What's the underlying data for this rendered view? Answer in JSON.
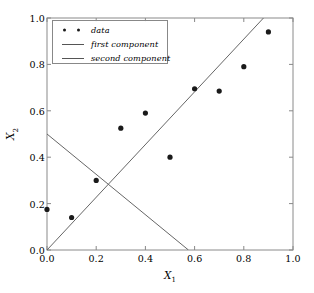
{
  "chart_data": {
    "type": "scatter",
    "title": "",
    "xlabel": "X",
    "xlabel_sub": "1",
    "ylabel": "X",
    "ylabel_sub": "2",
    "xlim": [
      0.0,
      1.0
    ],
    "ylim": [
      0.0,
      1.0
    ],
    "grid": false,
    "xticks": [
      "0.0",
      "0.2",
      "0.4",
      "0.6",
      "0.8",
      "1.0"
    ],
    "xtick_values": [
      0.0,
      0.2,
      0.4,
      0.6,
      0.8,
      1.0
    ],
    "yticks": [
      "0.0",
      "0.2",
      "0.4",
      "0.6",
      "0.8",
      "1.0"
    ],
    "ytick_values": [
      0.0,
      0.2,
      0.4,
      0.6,
      0.8,
      1.0
    ],
    "legend_position": "upper left",
    "marker_color": "#1a1a1a",
    "line_color": "#666666",
    "axis_color": "#888888",
    "series": [
      {
        "name": "data",
        "type": "scatter",
        "x": [
          0.0,
          0.1,
          0.2,
          0.3,
          0.4,
          0.5,
          0.6,
          0.7,
          0.8,
          0.9
        ],
        "y": [
          0.175,
          0.14,
          0.3,
          0.525,
          0.59,
          0.4,
          0.695,
          0.685,
          0.79,
          0.94
        ]
      },
      {
        "name": "first component",
        "type": "line",
        "x": [
          0.0,
          0.88
        ],
        "y": [
          0.0,
          1.0
        ]
      },
      {
        "name": "second component",
        "type": "line",
        "x": [
          0.0,
          0.575
        ],
        "y": [
          0.5,
          0.0
        ]
      }
    ]
  },
  "legend": {
    "entries": [
      {
        "label": "data",
        "marker": "dots"
      },
      {
        "label": "first component",
        "marker": "line"
      },
      {
        "label": "second component",
        "marker": "line"
      }
    ]
  }
}
